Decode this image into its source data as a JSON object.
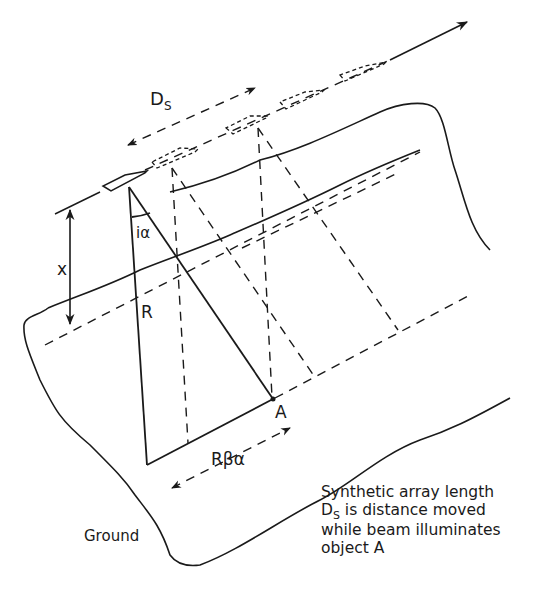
{
  "diagram": {
    "type": "synthetic-aperture-radar-geometry",
    "labels": {
      "ds_main": "D",
      "ds_sub": "S",
      "x": "x",
      "i_alpha": "iα",
      "r": "R",
      "a": "A",
      "r_beta_alpha": "Rβα",
      "ground": "Ground"
    },
    "caption": {
      "line1": "Synthetic array length",
      "line2_main": "D",
      "line2_sub": "S",
      "line2_rest": " is distance moved",
      "line3": "while beam illuminates",
      "line4": "object A"
    },
    "colors": {
      "ink": "#1a1a1a",
      "background": "#ffffff"
    }
  }
}
